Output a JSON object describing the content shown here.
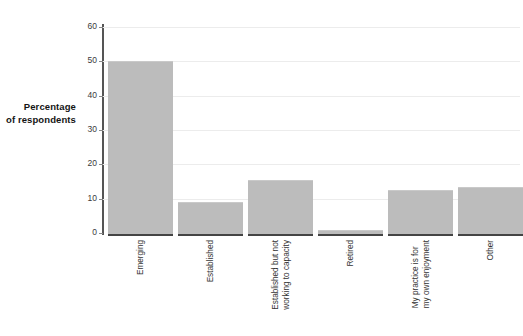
{
  "chart_data": {
    "type": "bar",
    "title": "",
    "subtitle": "",
    "xlabel": "",
    "ylabel": "Percentage of respondents",
    "ylabel_lines": [
      "Percentage",
      "of respondents"
    ],
    "categories": [
      "Emerging",
      "Established",
      "Established but not working to capacity",
      "Retired",
      "My practice is for my own enjoyment",
      "Other"
    ],
    "category_lines": [
      [
        "Emerging"
      ],
      [
        "Established"
      ],
      [
        "Established but not",
        "working to capacity"
      ],
      [
        "Retired"
      ],
      [
        "My practice is for",
        "my own enjoyment"
      ],
      [
        "Other"
      ]
    ],
    "values": [
      50,
      9,
      15.5,
      1,
      12.5,
      13.5
    ],
    "ylim": [
      0,
      60
    ],
    "yticks": [
      0,
      10,
      20,
      30,
      40,
      50,
      60
    ],
    "ytick_labels": [
      "0",
      "10",
      "20",
      "30",
      "40",
      "50",
      "60"
    ],
    "grid": true,
    "grid_axis": "y",
    "legend": null,
    "legend_position": "none",
    "bar_color": "#bcbcbc",
    "grid_color": "#ececec",
    "axis_color": "#444444",
    "background_color": "#ffffff"
  }
}
